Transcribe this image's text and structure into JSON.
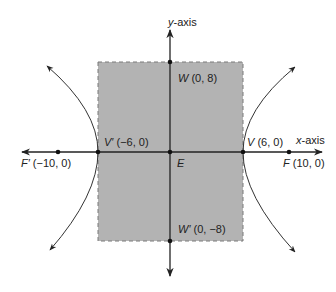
{
  "diagram": {
    "type": "hyperbola",
    "colors": {
      "box_fill": "#b3b3b3",
      "box_border": "#7a7a7a",
      "line": "#222222",
      "background": "#ffffff"
    },
    "axes": {
      "x_label_var": "x",
      "x_label_suffix": "-axis",
      "y_label_var": "y",
      "y_label_suffix": "-axis"
    },
    "center": {
      "name": "E"
    },
    "points": {
      "W": {
        "name": "W",
        "coords": "(0, 8)"
      },
      "W2": {
        "name": "W′",
        "coords": "(0, −8)"
      },
      "V": {
        "name": "V",
        "coords": "(6, 0)"
      },
      "V2": {
        "name": "V′",
        "coords": "(−6, 0)"
      },
      "F": {
        "name": "F",
        "coords": "(10, 0)"
      },
      "F2": {
        "name": "F′",
        "coords": "(−10, 0)"
      }
    }
  }
}
